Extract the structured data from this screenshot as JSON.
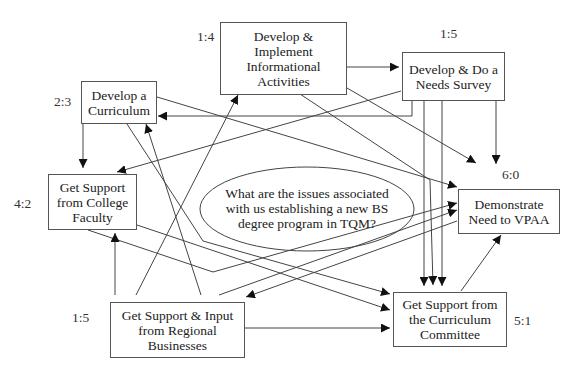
{
  "diagram": {
    "central_question": "What are the issues associated\nwith us establishing a new BS\ndegree program in TQM?",
    "nodes": {
      "informational": {
        "label": "Develop &\nImplement\nInformational\nActivities",
        "score": "1:4"
      },
      "needs_survey": {
        "label": "Develop & Do a\nNeeds Survey",
        "score": "1:5"
      },
      "curriculum": {
        "label": "Develop a\nCurriculum",
        "score": "2:3"
      },
      "faculty": {
        "label": "Get Support\nfrom College\nFaculty",
        "score": "4:2"
      },
      "vpaa": {
        "label": "Demonstrate\nNeed to VPAA",
        "score": "6:0"
      },
      "businesses": {
        "label": "Get Support & Input\nfrom Regional\nBusinesses",
        "score": "1:5"
      },
      "committee": {
        "label": "Get Support from\nthe Curriculum\nCommittee",
        "score": "5:1"
      }
    },
    "edges": [
      {
        "from": "informational",
        "to": "needs_survey"
      },
      {
        "from": "informational",
        "to": "vpaa"
      },
      {
        "from": "informational",
        "to": "committee"
      },
      {
        "from": "needs_survey",
        "to": "curriculum"
      },
      {
        "from": "needs_survey",
        "to": "faculty"
      },
      {
        "from": "needs_survey",
        "to": "vpaa"
      },
      {
        "from": "needs_survey",
        "to": "committee"
      },
      {
        "from": "curriculum",
        "to": "faculty"
      },
      {
        "from": "curriculum",
        "to": "vpaa"
      },
      {
        "from": "curriculum",
        "to": "committee"
      },
      {
        "from": "faculty",
        "to": "vpaa"
      },
      {
        "from": "faculty",
        "to": "committee"
      },
      {
        "from": "businesses",
        "to": "faculty"
      },
      {
        "from": "businesses",
        "to": "curriculum"
      },
      {
        "from": "businesses",
        "to": "informational"
      },
      {
        "from": "businesses",
        "to": "vpaa"
      },
      {
        "from": "businesses",
        "to": "committee"
      },
      {
        "from": "committee",
        "to": "vpaa"
      },
      {
        "from": "vpaa",
        "to": "businesses"
      }
    ]
  }
}
